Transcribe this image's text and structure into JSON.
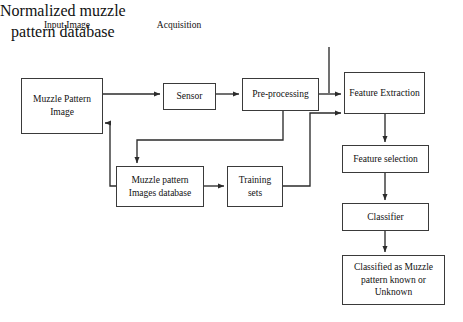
{
  "diagram": {
    "stroke_color": "#3a3a3a",
    "background_color": "#ffffff",
    "text_color": "#111111",
    "labels": {
      "input_image": "Input Image",
      "acquisition": "Acquisition",
      "normalized_database": "Normalized muzzle\npattern database"
    },
    "nodes": {
      "muzzle_pattern_image": "Muzzle Pattern\nImage",
      "sensor": "Sensor",
      "pre_processing": "Pre-processing",
      "feature_extraction": "Feature Extraction",
      "feature_selection": "Feature selection",
      "classifier": "Classifier",
      "classified_result": "Classified as Muzzle\npattern known or\nUnknown",
      "images_database": "Muzzle pattern\nImages database",
      "training_sets": "Training\nsets"
    },
    "edges": [
      {
        "id": "muzzle-image-to-sensor",
        "from": "muzzle_pattern_image",
        "to": "sensor"
      },
      {
        "id": "sensor-to-pre-processing",
        "from": "sensor",
        "to": "pre_processing"
      },
      {
        "id": "pre-processing-to-feature-extraction",
        "from": "pre_processing",
        "to": "feature_extraction"
      },
      {
        "id": "normalized-db-to-feature-extraction",
        "from": "normalized_database",
        "to": "feature_extraction"
      },
      {
        "id": "feature-extraction-to-feature-selection",
        "from": "feature_extraction",
        "to": "feature_selection"
      },
      {
        "id": "feature-selection-to-classifier",
        "from": "feature_selection",
        "to": "classifier"
      },
      {
        "id": "classifier-to-classified-result",
        "from": "classifier",
        "to": "classified_result"
      },
      {
        "id": "pre-processing-to-images-database",
        "from": "pre_processing",
        "to": "images_database"
      },
      {
        "id": "images-database-to-training-sets",
        "from": "images_database",
        "to": "training_sets"
      },
      {
        "id": "training-sets-to-feature-extraction",
        "from": "training_sets",
        "to": "feature_extraction"
      },
      {
        "id": "images-database-to-muzzle-image-feedback",
        "from": "images_database",
        "to": "muzzle_pattern_image"
      }
    ]
  }
}
